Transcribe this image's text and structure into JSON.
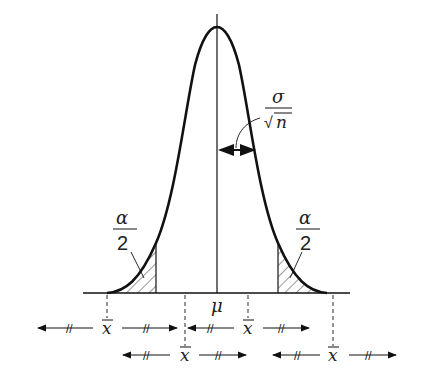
{
  "diagram": {
    "title": "",
    "curve_type": "normal distribution",
    "center_label": "μ",
    "spread_label": {
      "numerator": "σ",
      "denominator": "n",
      "radical": "√"
    },
    "tail_labels": [
      {
        "numerator": "α",
        "denominator": "2",
        "side": "left"
      },
      {
        "numerator": "α",
        "denominator": "2",
        "side": "right"
      }
    ],
    "sample_mean_label": "x",
    "interval_markers": [
      {
        "row": 1,
        "center_label": "x",
        "break_mark": "//"
      },
      {
        "row": 1,
        "center_label": "x",
        "break_mark": "//"
      },
      {
        "row": 2,
        "center_label": "x",
        "break_mark": "//"
      },
      {
        "row": 2,
        "center_label": "x",
        "break_mark": "//"
      }
    ],
    "colors": {
      "stroke": "#111111",
      "background": "#ffffff"
    }
  }
}
